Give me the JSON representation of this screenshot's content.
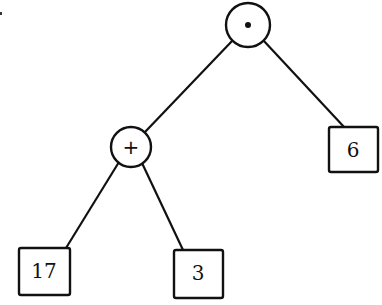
{
  "diagram": {
    "type": "expression-tree",
    "expression": "(17 + 3) · 6",
    "nodes": {
      "root": {
        "kind": "operator",
        "label": "·",
        "meaning": "multiply"
      },
      "plus": {
        "kind": "operator",
        "label": "+",
        "meaning": "add"
      },
      "six": {
        "kind": "operand",
        "label": "6"
      },
      "seventeen": {
        "kind": "operand",
        "label": "17"
      },
      "three": {
        "kind": "operand",
        "label": "3"
      }
    },
    "edges": [
      {
        "from": "root",
        "to": "plus"
      },
      {
        "from": "root",
        "to": "six"
      },
      {
        "from": "plus",
        "to": "seventeen"
      },
      {
        "from": "plus",
        "to": "three"
      }
    ]
  }
}
